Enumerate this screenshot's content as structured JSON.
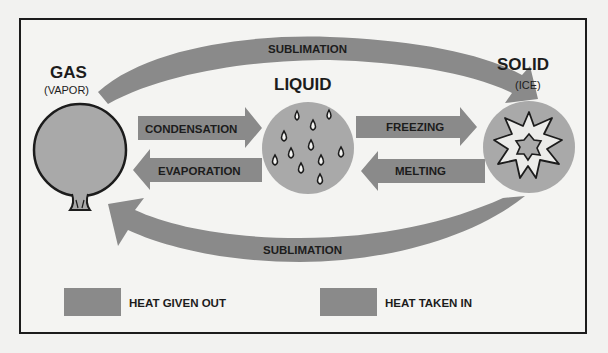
{
  "states": {
    "gas": {
      "title": "GAS",
      "subtitle": "(VAPOR)"
    },
    "liquid": {
      "title": "LIQUID"
    },
    "solid": {
      "title": "SOLID",
      "subtitle": "(ICE)"
    }
  },
  "arrows": {
    "sublimation_top": "SUBLIMATION",
    "condensation": "CONDENSATION",
    "evaporation": "EVAPORATION",
    "freezing": "FREEZING",
    "melting": "MELTING",
    "sublimation_bottom": "SUBLIMATION"
  },
  "legend": {
    "heat_given_out": "HEAT GIVEN OUT",
    "heat_taken_in": "HEAT TAKEN IN"
  },
  "colors": {
    "background": "#f2f2f0",
    "arrow_fill": "#8a8a8a",
    "circle_fill": "#a9a9a9",
    "border": "#1c1c1c"
  }
}
